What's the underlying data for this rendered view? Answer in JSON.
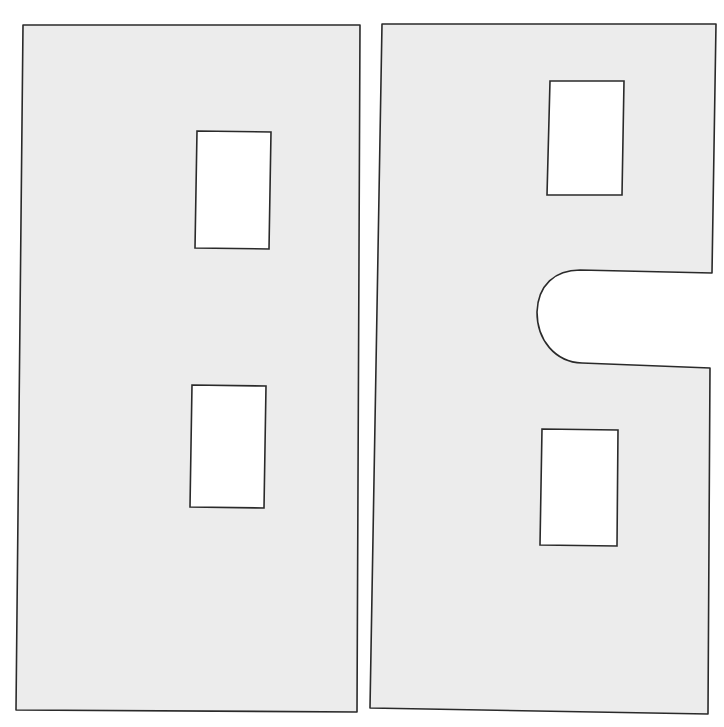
{
  "diagram": {
    "background": "#ffffff",
    "panel_fill": "#ececec",
    "stroke": "#2a2a2a",
    "cutout_fill": "#ffffff",
    "panels": [
      {
        "name": "left-panel",
        "outline": "M23,25 L360,25 L357,712 L16,710 Z",
        "cutouts": [
          {
            "name": "upper-window-cutout",
            "d": "M197,131 L271,132 L269,249 L195,248 Z"
          },
          {
            "name": "lower-window-cutout",
            "d": "M192,385 L266,386 L264,508 L190,507 Z"
          }
        ]
      },
      {
        "name": "right-panel",
        "outline": "M382,24 L716,24 L712,273 L580,270 C555,270 538,285 537,312 C537,340 555,362 582,363 L710,368 L708,714 L370,708 Z",
        "cutouts": [
          {
            "name": "upper-window-cutout",
            "d": "M550,81 L624,81 L622,195 L547,195 Z"
          },
          {
            "name": "lower-window-cutout",
            "d": "M542,429 L618,430 L617,546 L540,545 Z"
          }
        ]
      }
    ]
  }
}
